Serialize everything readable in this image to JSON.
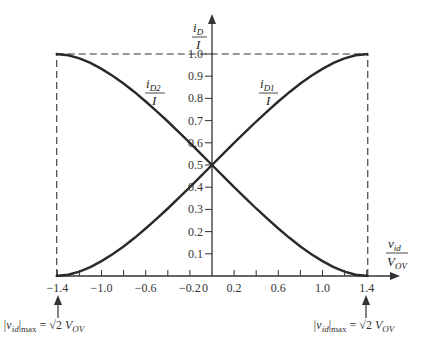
{
  "chart_data": {
    "type": "line",
    "title": "",
    "xlabel": "v_id / V_OV",
    "ylabel": "i_D / I",
    "xlim": [
      -1.4142,
      1.4142
    ],
    "ylim": [
      0,
      1.0
    ],
    "grid": false,
    "x_ticks": [
      -1.4,
      -1.2,
      -1.0,
      -0.8,
      -0.6,
      -0.4,
      -0.2,
      0,
      0.2,
      0.4,
      0.6,
      0.8,
      1.0,
      1.2,
      1.4
    ],
    "x_tick_labels": [
      {
        "value": -1.4,
        "label": "−1.4"
      },
      {
        "value": -1.0,
        "label": "−1.0"
      },
      {
        "value": -0.6,
        "label": "−0.6"
      },
      {
        "value": -0.2,
        "label": "−0.2"
      },
      {
        "value": 0,
        "label": "0"
      },
      {
        "value": 0.2,
        "label": "0.2"
      },
      {
        "value": 0.6,
        "label": "0.6"
      },
      {
        "value": 1.0,
        "label": "1.0"
      },
      {
        "value": 1.4,
        "label": "1.4"
      }
    ],
    "y_ticks": [
      0.1,
      0.2,
      0.3,
      0.4,
      0.5,
      0.6,
      0.7,
      0.8,
      0.9,
      1.0
    ],
    "y_tick_labels": [
      "0.1",
      "0.2",
      "0.3",
      "0.4",
      "0.5",
      "0.6",
      "0.7",
      "0.8",
      "0.9",
      "1.0"
    ],
    "x": [
      -1.4142,
      -1.3,
      -1.2,
      -1.1,
      -1.0,
      -0.9,
      -0.8,
      -0.7,
      -0.6,
      -0.5,
      -0.4,
      -0.3,
      -0.2,
      -0.1,
      0,
      0.1,
      0.2,
      0.3,
      0.4,
      0.5,
      0.6,
      0.7,
      0.8,
      0.9,
      1.0,
      1.1,
      1.2,
      1.3,
      1.4142
    ],
    "series": [
      {
        "name": "i_D1 / I",
        "values": [
          0.0,
          0.006,
          0.02,
          0.04,
          0.067,
          0.098,
          0.133,
          0.172,
          0.214,
          0.258,
          0.304,
          0.352,
          0.4,
          0.45,
          0.5,
          0.55,
          0.6,
          0.648,
          0.696,
          0.742,
          0.786,
          0.828,
          0.867,
          0.902,
          0.933,
          0.96,
          0.98,
          0.994,
          1.0
        ]
      },
      {
        "name": "i_D2 / I",
        "values": [
          1.0,
          0.994,
          0.98,
          0.96,
          0.933,
          0.902,
          0.867,
          0.828,
          0.786,
          0.742,
          0.696,
          0.648,
          0.6,
          0.55,
          0.5,
          0.45,
          0.4,
          0.352,
          0.304,
          0.258,
          0.214,
          0.172,
          0.133,
          0.098,
          0.067,
          0.04,
          0.02,
          0.006,
          0.0
        ]
      }
    ],
    "annotations": [
      {
        "text": "|v_id|max = √2 V_OV",
        "at_x": -1.4142,
        "position": "below-left"
      },
      {
        "text": "|v_id|max = √2 V_OV",
        "at_x": 1.4142,
        "position": "below-right"
      },
      {
        "text": "dashed box from y=0 to y=1.0 at x = ±√2"
      }
    ]
  },
  "labels": {
    "y_axis": {
      "num": "i",
      "num_sub": "D",
      "den": "I"
    },
    "x_axis": {
      "num": "v",
      "num_sub": "id",
      "den": "V",
      "den_sub": "OV"
    },
    "curve1": {
      "num": "i",
      "num_sub": "D1",
      "den": "I"
    },
    "curve2": {
      "num": "i",
      "num_sub": "D2",
      "den": "I"
    },
    "ann_left": {
      "lhs": "|v",
      "lhs_sub": "id",
      "bar": "|",
      "max": "max",
      "eq": " = ",
      "sqrt": "√2",
      "rhs": " V",
      "rhs_sub": "OV"
    },
    "ann_right": {
      "lhs": "|v",
      "lhs_sub": "id",
      "bar": "|",
      "max": "max",
      "eq": " = ",
      "sqrt": "√2",
      "rhs": " V",
      "rhs_sub": "OV"
    }
  },
  "colors": {
    "curve": "#2a2a2a",
    "axis": "#333333",
    "dash": "#333333",
    "text": "#333333"
  }
}
